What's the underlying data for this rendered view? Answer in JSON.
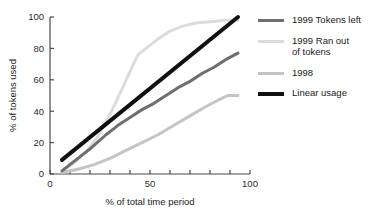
{
  "chart_data": {
    "type": "line",
    "title": "",
    "xlabel": "% of total time period",
    "ylabel": "% of tokens used",
    "xlim": [
      0,
      100
    ],
    "ylim": [
      0,
      100
    ],
    "xticks": [
      0,
      10,
      20,
      30,
      40,
      50,
      60,
      70,
      80,
      90,
      100
    ],
    "xticklabels": [
      "0",
      "",
      "",
      "",
      "",
      "50",
      "",
      "",
      "",
      "",
      "100"
    ],
    "yticks": [
      0,
      20,
      40,
      60,
      80,
      100
    ],
    "yticklabels": [
      "0",
      "20",
      "40",
      "60",
      "80",
      "100"
    ],
    "grid": false,
    "legend_position": "right",
    "series": [
      {
        "name": "1999 Tokens left",
        "color": "#6e6e6e",
        "width": 3,
        "x": [
          6,
          12,
          20,
          28,
          34,
          40,
          46,
          52,
          58,
          64,
          70,
          76,
          82,
          88,
          94
        ],
        "y": [
          2,
          8,
          16,
          25,
          31,
          36,
          41,
          45,
          50,
          55,
          59,
          64,
          68,
          73,
          77
        ]
      },
      {
        "name": "1999 Ran out\nof tokens",
        "color": "#dcdcdc",
        "width": 3,
        "x": [
          6,
          12,
          18,
          24,
          30,
          36,
          41,
          44,
          48,
          54,
          60,
          66,
          72,
          80,
          88,
          94
        ],
        "y": [
          2,
          7,
          14,
          24,
          38,
          54,
          68,
          76,
          80,
          86,
          91,
          94,
          96,
          97,
          98,
          98
        ]
      },
      {
        "name": "1998",
        "color": "#c4c4c4",
        "width": 3,
        "x": [
          6,
          14,
          22,
          30,
          38,
          46,
          54,
          62,
          70,
          78,
          84,
          89,
          94
        ],
        "y": [
          1,
          3,
          6,
          10,
          15,
          20,
          25,
          31,
          37,
          43,
          47,
          50,
          50
        ]
      },
      {
        "name": "Linear usage",
        "color": "#111111",
        "width": 4,
        "x": [
          6,
          94
        ],
        "y": [
          9,
          100
        ]
      }
    ]
  },
  "legend": {
    "items": [
      {
        "label": "1999 Tokens left",
        "color": "#6e6e6e",
        "thick": false
      },
      {
        "label": "1999 Ran out\nof tokens",
        "color": "#dcdcdc",
        "thick": false
      },
      {
        "label": "1998",
        "color": "#c4c4c4",
        "thick": false
      },
      {
        "label": "Linear usage",
        "color": "#111111",
        "thick": true
      }
    ]
  }
}
